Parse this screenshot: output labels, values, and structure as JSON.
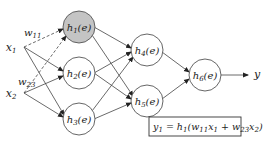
{
  "inputs": [
    {
      "id": "x1",
      "base": "x",
      "sub": "1",
      "x": 15,
      "y": 47
    },
    {
      "id": "x2",
      "base": "x",
      "sub": "2",
      "x": 15,
      "y": 93
    }
  ],
  "nodes": [
    {
      "id": "h1",
      "base": "h",
      "sub": "1",
      "arg": "(e)",
      "cx": 79,
      "cy": 27,
      "shaded": true
    },
    {
      "id": "h2",
      "base": "h",
      "sub": "2",
      "arg": "(e)",
      "cx": 79,
      "cy": 73,
      "shaded": false
    },
    {
      "id": "h3",
      "base": "h",
      "sub": "3",
      "arg": "(e)",
      "cx": 79,
      "cy": 119,
      "shaded": false
    },
    {
      "id": "h4",
      "base": "h",
      "sub": "4",
      "arg": "(e)",
      "cx": 147,
      "cy": 50,
      "shaded": false
    },
    {
      "id": "h5",
      "base": "h",
      "sub": "5",
      "arg": "(e)",
      "cx": 147,
      "cy": 101,
      "shaded": false
    },
    {
      "id": "h6",
      "base": "h",
      "sub": "6",
      "arg": "(e)",
      "cx": 205,
      "cy": 75,
      "shaded": false
    }
  ],
  "weights": [
    {
      "label": "w",
      "sub": "11",
      "x": 24,
      "y": 35
    },
    {
      "label": "w",
      "sub": "23",
      "x": 20,
      "y": 84
    }
  ],
  "output": {
    "label": "y",
    "x": 254,
    "y": 78
  },
  "equation": {
    "lhs": "y",
    "lhs_sub": "1",
    "rhs": "= h",
    "rhs_sub": "1",
    "inner": "(w",
    "w1_sub": "11",
    "x1": "x",
    "x1_sub": "1",
    "plus": " + w",
    "w2_sub": "23",
    "x2": "x",
    "x2_sub": "2",
    "close": ")"
  },
  "colors": {
    "shaded_node": "#c4c4c4",
    "stroke": "#444444",
    "background": "#ffffff"
  }
}
